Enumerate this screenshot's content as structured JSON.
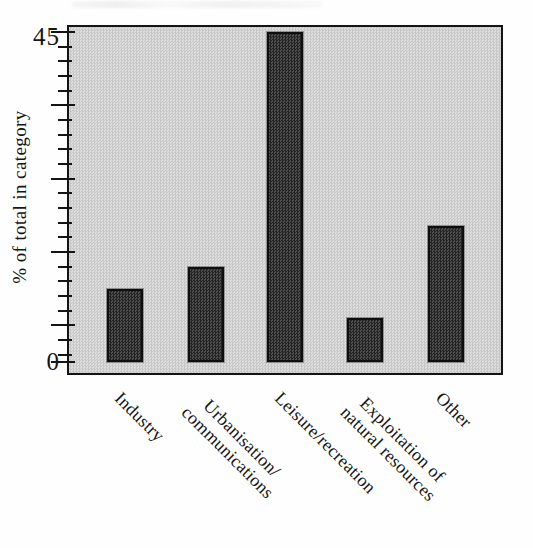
{
  "chart_data": {
    "type": "bar",
    "title": "",
    "categories": [
      "Industry",
      "Urbanisation/communications",
      "Leisure/recreation",
      "Exploitation of natural resources",
      "Other"
    ],
    "values": [
      10,
      13,
      45,
      6,
      18.5
    ],
    "xlabel": "",
    "ylabel": "% of total in category",
    "ylim": [
      0,
      45
    ],
    "ytick_labels_shown": [
      "45",
      "0"
    ],
    "ytick_major_values": [
      45,
      35,
      25,
      15,
      5,
      0
    ],
    "ytick_minor_step": 2,
    "grid": false,
    "legend_position": "none",
    "x_label_rotation_deg": 45,
    "bar_fill": "#3a3a3a",
    "bar_edge": "#0e0e0e",
    "plot_background": "#d2d2d2",
    "frame_color": "#141414"
  },
  "display": {
    "y_top_label": "45",
    "y_bottom_label": "0",
    "y_title": "% of total in category",
    "x_labels": [
      "Industry",
      "Urbanisation/\ncommunications",
      "Leisure/recreation",
      "Exploitation of\nnatural resources",
      "Other"
    ]
  }
}
